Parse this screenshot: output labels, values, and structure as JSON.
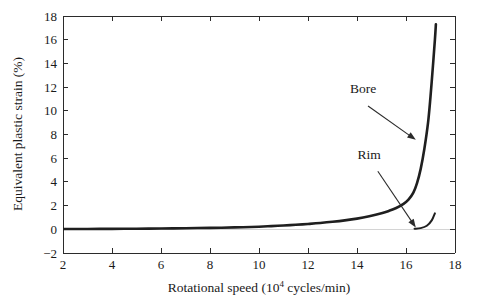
{
  "chart_data": {
    "type": "line",
    "title": "",
    "xlabel": "Rotational speed (10⁴ cycles/min)",
    "xlabel_base": "Rotational speed (10",
    "xlabel_sup": "4",
    "xlabel_tail": " cycles/min)",
    "ylabel": "Equivalent plastic strain (%)",
    "xlim": [
      2,
      18
    ],
    "ylim": [
      -2,
      18
    ],
    "xticks": [
      2,
      4,
      6,
      8,
      10,
      12,
      14,
      16,
      18
    ],
    "xtick_labels": [
      "2",
      "4",
      "6",
      "8",
      "10",
      "12",
      "14",
      "16",
      "18"
    ],
    "yticks": [
      -2,
      0,
      2,
      4,
      6,
      8,
      10,
      12,
      14,
      16,
      18
    ],
    "ytick_labels": [
      "−2",
      "0",
      "2",
      "4",
      "6",
      "8",
      "10",
      "12",
      "14",
      "16",
      "18"
    ],
    "grid": false,
    "legend": "none",
    "line_color": "#1f1f1f",
    "series": [
      {
        "name": "Bore",
        "points": [
          [
            2.0,
            0.02
          ],
          [
            3.0,
            0.03
          ],
          [
            4.0,
            0.04
          ],
          [
            5.0,
            0.05
          ],
          [
            6.0,
            0.07
          ],
          [
            7.0,
            0.09
          ],
          [
            8.0,
            0.12
          ],
          [
            9.0,
            0.16
          ],
          [
            10.0,
            0.22
          ],
          [
            10.5,
            0.27
          ],
          [
            11.0,
            0.32
          ],
          [
            11.5,
            0.38
          ],
          [
            12.0,
            0.45
          ],
          [
            12.5,
            0.53
          ],
          [
            13.0,
            0.63
          ],
          [
            13.5,
            0.75
          ],
          [
            14.0,
            0.9
          ],
          [
            14.5,
            1.1
          ],
          [
            15.0,
            1.35
          ],
          [
            15.3,
            1.55
          ],
          [
            15.6,
            1.8
          ],
          [
            15.9,
            2.15
          ],
          [
            16.1,
            2.5
          ],
          [
            16.3,
            3.1
          ],
          [
            16.45,
            3.9
          ],
          [
            16.6,
            5.1
          ],
          [
            16.75,
            6.8
          ],
          [
            16.9,
            9.0
          ],
          [
            17.0,
            11.2
          ],
          [
            17.1,
            13.8
          ],
          [
            17.18,
            16.0
          ],
          [
            17.22,
            17.3
          ]
        ]
      },
      {
        "name": "Rim",
        "points": [
          [
            16.35,
            0.05
          ],
          [
            16.6,
            0.1
          ],
          [
            16.85,
            0.3
          ],
          [
            17.05,
            0.75
          ],
          [
            17.18,
            1.35
          ]
        ]
      }
    ],
    "annotations": [
      {
        "label": "Bore",
        "label_x": 14.25,
        "label_y": 11.5,
        "arrow_from_x": 14.45,
        "arrow_from_y": 10.4,
        "arrow_to_x": 16.4,
        "arrow_to_y": 7.55
      },
      {
        "label": "Rim",
        "label_x": 14.5,
        "label_y": 5.9,
        "arrow_from_x": 14.85,
        "arrow_from_y": 4.9,
        "arrow_to_x": 16.4,
        "arrow_to_y": 0.15
      }
    ]
  }
}
